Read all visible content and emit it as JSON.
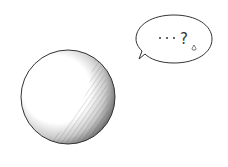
{
  "illustration": {
    "subject": "shaded sphere",
    "speech_bubble": {
      "text": "···?",
      "drop": "sweat-drop"
    },
    "colors": {
      "background": "#ffffff",
      "line": "#333333",
      "shade": "#555555"
    }
  }
}
